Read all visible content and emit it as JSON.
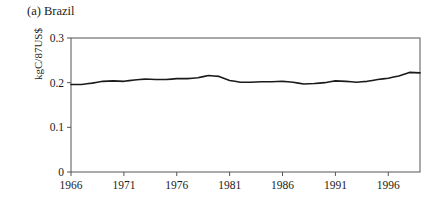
{
  "figure": {
    "panel_title": "(a) Brazil",
    "ylabel": "kgC/87US$"
  },
  "chart_data": {
    "type": "line",
    "title": "(a) Brazil",
    "xlabel": "",
    "ylabel": "kgC/87US$",
    "xlim": [
      1966,
      1999
    ],
    "ylim": [
      0,
      0.3
    ],
    "yticks": [
      0,
      0.1,
      0.2,
      0.3
    ],
    "ytick_labels": [
      "0",
      "0.1",
      "0.2",
      "0.3"
    ],
    "xticks": [
      1966,
      1971,
      1976,
      1981,
      1986,
      1991,
      1996
    ],
    "xtick_labels": [
      "1966",
      "1971",
      "1976",
      "1981",
      "1986",
      "1991",
      "1996"
    ],
    "grid": false,
    "legend": null,
    "line_color": "#1a1a1a",
    "series": [
      {
        "name": "Brazil carbon intensity",
        "x": [
          1966,
          1967,
          1968,
          1969,
          1970,
          1971,
          1972,
          1973,
          1974,
          1975,
          1976,
          1977,
          1978,
          1979,
          1980,
          1981,
          1982,
          1983,
          1984,
          1985,
          1986,
          1987,
          1988,
          1989,
          1990,
          1991,
          1992,
          1993,
          1994,
          1995,
          1996,
          1997,
          1998,
          1999
        ],
        "values": [
          0.196,
          0.196,
          0.199,
          0.203,
          0.204,
          0.203,
          0.206,
          0.208,
          0.207,
          0.207,
          0.209,
          0.209,
          0.211,
          0.216,
          0.214,
          0.205,
          0.201,
          0.201,
          0.202,
          0.202,
          0.203,
          0.201,
          0.197,
          0.198,
          0.2,
          0.204,
          0.203,
          0.201,
          0.203,
          0.207,
          0.21,
          0.215,
          0.223,
          0.222
        ]
      }
    ]
  }
}
